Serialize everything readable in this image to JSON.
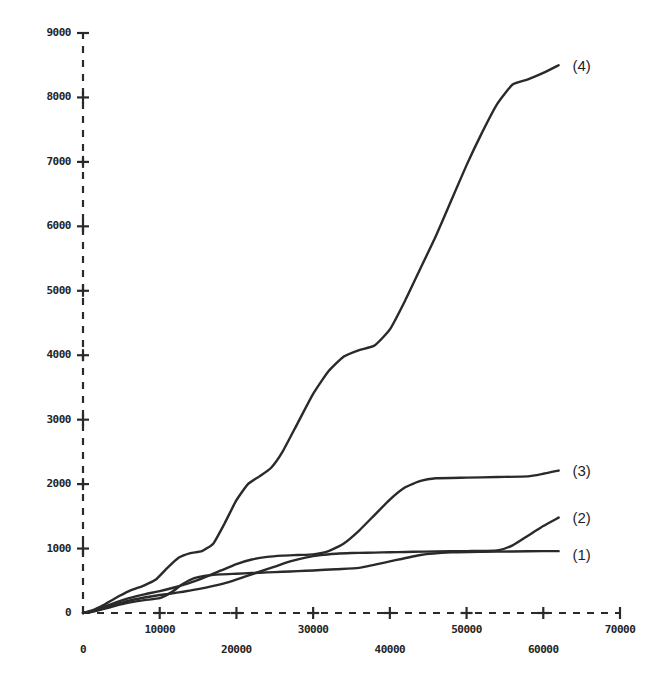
{
  "chart_data": {
    "type": "line",
    "title": "",
    "subtitle": "",
    "xlabel": "",
    "ylabel": "",
    "xlim": [
      0,
      70000
    ],
    "ylim": [
      0,
      9000
    ],
    "grid": false,
    "legend_position": "right-of-curve-ends",
    "axis_style": "dashed",
    "line_color": "#2a2a2a",
    "background_color": "#ffffff",
    "x_ticks": [
      0,
      10000,
      20000,
      30000,
      40000,
      50000,
      60000,
      70000
    ],
    "x_tick_labels": [
      "0",
      "10000",
      "20000",
      "30000",
      "40000",
      "50000",
      "60000",
      "70000"
    ],
    "y_ticks": [
      0,
      1000,
      2000,
      3000,
      4000,
      5000,
      6000,
      7000,
      8000,
      9000
    ],
    "y_tick_labels": [
      "0",
      "1000",
      "2000",
      "3000",
      "4000",
      "5000",
      "6000",
      "7000",
      "8000",
      "9000"
    ],
    "annotations": [
      {
        "text": "(4)",
        "x": 63800,
        "y": 8480
      },
      {
        "text": "(3)",
        "x": 63800,
        "y": 2190
      },
      {
        "text": "(2)",
        "x": 63800,
        "y": 1460
      },
      {
        "text": "(1)",
        "x": 63800,
        "y": 890
      }
    ],
    "series": [
      {
        "name": "(1)",
        "label": "(1)",
        "x": [
          0,
          1200,
          2600,
          4200,
          6000,
          8000,
          10000,
          11500,
          13000,
          14500,
          16000,
          18000,
          20000,
          22000,
          24000,
          26000,
          28000,
          30000,
          33000,
          36000,
          40000,
          44000,
          48000,
          52000,
          56000,
          60000,
          62000
        ],
        "values": [
          0,
          20,
          60,
          110,
          160,
          200,
          230,
          320,
          450,
          540,
          580,
          600,
          610,
          620,
          630,
          640,
          650,
          660,
          680,
          700,
          800,
          900,
          940,
          950,
          955,
          960,
          960
        ]
      },
      {
        "name": "(2)",
        "label": "(2)",
        "x": [
          0,
          1200,
          2600,
          4200,
          6000,
          8000,
          10000,
          11500,
          13000,
          15000,
          17000,
          19000,
          21000,
          23000,
          25000,
          27000,
          29000,
          31000,
          33000,
          35000,
          37000,
          39000,
          41000,
          43000,
          46000,
          50000,
          54000,
          56000,
          58000,
          60000,
          62000
        ],
        "values": [
          0,
          25,
          70,
          130,
          190,
          240,
          280,
          300,
          330,
          370,
          420,
          480,
          560,
          640,
          720,
          800,
          860,
          900,
          920,
          930,
          935,
          940,
          945,
          950,
          955,
          960,
          970,
          1050,
          1200,
          1350,
          1480
        ]
      },
      {
        "name": "(3)",
        "label": "(3)",
        "x": [
          0,
          1200,
          2600,
          4200,
          6000,
          8000,
          10000,
          12000,
          14000,
          16000,
          18000,
          20000,
          22000,
          24000,
          26000,
          28000,
          30000,
          32000,
          34000,
          36000,
          38000,
          40000,
          42000,
          44000,
          46000,
          50000,
          54000,
          58000,
          60000,
          62000
        ],
        "values": [
          0,
          30,
          90,
          160,
          230,
          290,
          340,
          400,
          470,
          560,
          660,
          760,
          830,
          870,
          890,
          900,
          910,
          960,
          1080,
          1280,
          1520,
          1760,
          1950,
          2050,
          2090,
          2100,
          2110,
          2120,
          2160,
          2210
        ]
      },
      {
        "name": "(4)",
        "label": "(4)",
        "x": [
          0,
          1200,
          2600,
          4200,
          6000,
          8000,
          9500,
          11000,
          12500,
          14000,
          15500,
          17000,
          18500,
          20000,
          21500,
          23000,
          24500,
          26000,
          28000,
          30000,
          32000,
          34000,
          36000,
          38000,
          40000,
          42000,
          44000,
          46000,
          48000,
          50000,
          52000,
          54000,
          56000,
          58000,
          60000,
          62000
        ],
        "values": [
          0,
          40,
          120,
          230,
          340,
          430,
          520,
          700,
          860,
          930,
          960,
          1080,
          1400,
          1750,
          2000,
          2120,
          2250,
          2500,
          2950,
          3400,
          3750,
          3980,
          4080,
          4150,
          4400,
          4850,
          5350,
          5850,
          6400,
          6950,
          7450,
          7900,
          8200,
          8280,
          8380,
          8500
        ]
      }
    ]
  },
  "plot_geometry": {
    "origin_x_px": 83,
    "origin_y_px": 613,
    "x_end_px": 620,
    "y_end_px": 33
  }
}
